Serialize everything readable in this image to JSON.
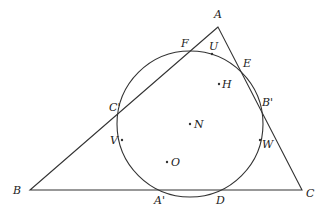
{
  "diagram": {
    "triangle": {
      "A": {
        "label": "A",
        "x": 218,
        "y": 27
      },
      "B": {
        "label": "B",
        "x": 30,
        "y": 190
      },
      "C": {
        "label": "C",
        "x": 302,
        "y": 190
      }
    },
    "circle": {
      "center_label": "N",
      "cx": 190,
      "cy": 124,
      "r": 73
    },
    "points": [
      {
        "label": "F",
        "x": 188,
        "y": 51,
        "lx": 181,
        "ly": 47
      },
      {
        "label": "U",
        "x": 212,
        "y": 54,
        "lx": 209,
        "ly": 50
      },
      {
        "label": "E",
        "x": 241,
        "y": 70,
        "lx": 243,
        "ly": 67
      },
      {
        "label": "H",
        "x": 219,
        "y": 84,
        "lx": 222,
        "ly": 88
      },
      {
        "label": "B'",
        "x": 261,
        "y": 109,
        "lx": 262,
        "ly": 106
      },
      {
        "label": "C'",
        "x": 120,
        "y": 109,
        "lx": 109,
        "ly": 111
      },
      {
        "label": "N",
        "x": 190,
        "y": 124,
        "lx": 194,
        "ly": 128
      },
      {
        "label": "V",
        "x": 122,
        "y": 140,
        "lx": 110,
        "ly": 144
      },
      {
        "label": "W",
        "x": 260,
        "y": 140,
        "lx": 262,
        "ly": 148
      },
      {
        "label": "O",
        "x": 167,
        "y": 162,
        "lx": 171,
        "ly": 166
      },
      {
        "label": "A'",
        "x": 162,
        "y": 190,
        "lx": 154,
        "ly": 204
      },
      {
        "label": "D",
        "x": 217,
        "y": 190,
        "lx": 216,
        "ly": 204
      }
    ],
    "vertex_labels": [
      {
        "label": "A",
        "x": 214,
        "y": 18
      },
      {
        "label": "B",
        "x": 13,
        "y": 194
      },
      {
        "label": "C",
        "x": 306,
        "y": 197
      }
    ]
  }
}
